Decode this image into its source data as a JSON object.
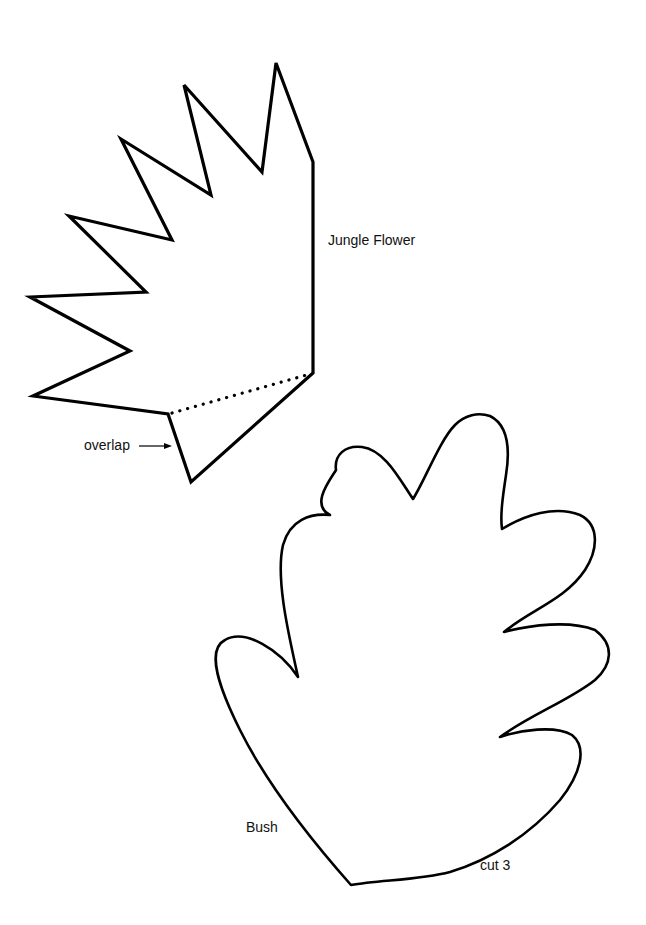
{
  "page": {
    "background": "#ffffff",
    "stroke_color": "#000000"
  },
  "shapes": {
    "jungle_flower": {
      "label": "Jungle Flower",
      "overlap_label": "overlap",
      "vertices": [
        [
          276,
          63
        ],
        [
          313,
          162
        ],
        [
          313,
          373
        ],
        [
          191,
          482
        ],
        [
          168,
          414
        ],
        [
          33,
          396
        ],
        [
          130,
          351
        ],
        [
          30,
          297
        ],
        [
          146,
          292
        ],
        [
          69,
          216
        ],
        [
          172,
          240
        ],
        [
          121,
          139
        ],
        [
          211,
          195
        ],
        [
          184,
          85
        ],
        [
          262,
          172
        ]
      ],
      "fold_line": [
        [
          168,
          414
        ],
        [
          313,
          373
        ]
      ]
    },
    "bush": {
      "label": "Bush",
      "instruction": "cut 3"
    }
  }
}
